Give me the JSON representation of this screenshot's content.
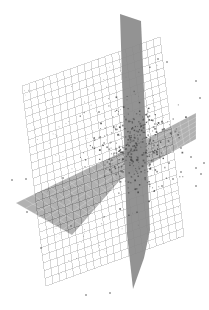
{
  "figure": {
    "title": "",
    "background_color": "#ffffff",
    "width": 209,
    "height": 310
  },
  "chart_data": {
    "type": "scatter",
    "title": "",
    "subtitle": "",
    "xlabel": "",
    "ylabel": "",
    "zlabel": "",
    "projection": "3d",
    "grid": true,
    "legend": null,
    "axis_ticks": [],
    "tick_labels": [],
    "colors": {
      "grid_plane_line": "#a9a9a9",
      "grid_plane_fill": "#ffffff",
      "vertical_plane": "#8a8a8a",
      "horizontal_plane": "#9b9b9b",
      "point_color": "#4a4a4a",
      "background": "#ffffff"
    },
    "planes": [
      {
        "name": "wireframe-grid-plane",
        "style": "wireframe",
        "fill": "#ffffff",
        "stroke": "#a9a9a9",
        "rows": 26,
        "cols": 20,
        "corners": [
          [
            22,
            86
          ],
          [
            160,
            37
          ],
          [
            184,
            236
          ],
          [
            46,
            286
          ]
        ]
      },
      {
        "name": "vertical-slice-plane",
        "style": "solid",
        "fill": "#8a8a8a",
        "corners": [
          [
            123,
            15
          ],
          [
            142,
            22
          ],
          [
            150,
            258
          ],
          [
            131,
            289
          ]
        ]
      },
      {
        "name": "horizontal-slice-plane",
        "style": "solid",
        "fill": "#9b9b9b",
        "corners": [
          [
            16,
            203
          ],
          [
            120,
            155
          ],
          [
            196,
            113
          ],
          [
            110,
            179
          ]
        ]
      }
    ],
    "series": [
      {
        "name": "data-cloud",
        "marker": "dot",
        "marker_size": 1.2,
        "color": "#4a4a4a",
        "n_points": 360,
        "cluster_center": [
          133,
          147
        ],
        "cluster_spread": [
          18,
          22
        ]
      },
      {
        "name": "outliers",
        "marker": "dot",
        "marker_size": 1.4,
        "color": "#4a4a4a",
        "points": [
          [
            167,
            62
          ],
          [
            196,
            81
          ],
          [
            200,
            98
          ],
          [
            12,
            180
          ],
          [
            181,
            148
          ],
          [
            191,
            157
          ],
          [
            169,
            163
          ],
          [
            196,
            168
          ],
          [
            181,
            172
          ],
          [
            173,
            179
          ],
          [
            201,
            174
          ],
          [
            162,
            186
          ],
          [
            196,
            186
          ],
          [
            27,
            212
          ],
          [
            86,
            295
          ],
          [
            110,
            293
          ],
          [
            26,
            179
          ],
          [
            204,
            163
          ],
          [
            158,
            59
          ],
          [
            150,
            140
          ],
          [
            63,
            178
          ],
          [
            71,
            226
          ],
          [
            41,
            248
          ],
          [
            99,
            112
          ]
        ]
      }
    ]
  }
}
